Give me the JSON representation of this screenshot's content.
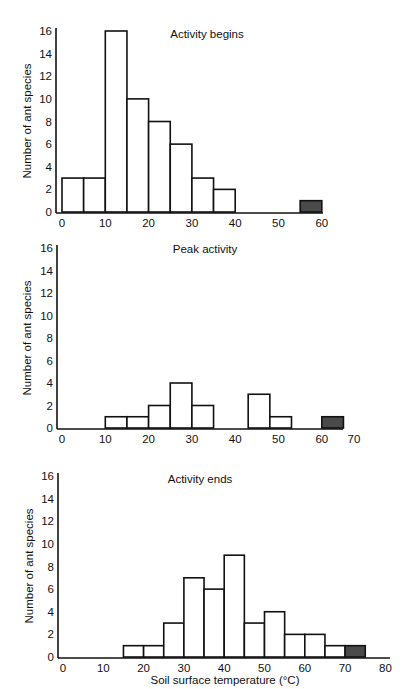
{
  "chart_data": [
    {
      "type": "bar",
      "title": "Activity begins",
      "xlabel": "",
      "ylabel": "Number of ant species",
      "ylim": [
        0,
        16
      ],
      "yticks": [
        0,
        2,
        4,
        6,
        8,
        10,
        12,
        14,
        16
      ],
      "xticks": [
        0,
        10,
        20,
        30,
        40,
        50,
        60
      ],
      "xlim": [
        0,
        60
      ],
      "bin_width": 5,
      "bins": [
        {
          "start": 0,
          "end": 5,
          "value": 3,
          "shaded": false
        },
        {
          "start": 5,
          "end": 10,
          "value": 3,
          "shaded": false
        },
        {
          "start": 10,
          "end": 15,
          "value": 16,
          "shaded": false
        },
        {
          "start": 15,
          "end": 20,
          "value": 10,
          "shaded": false
        },
        {
          "start": 20,
          "end": 25,
          "value": 8,
          "shaded": false
        },
        {
          "start": 25,
          "end": 30,
          "value": 6,
          "shaded": false
        },
        {
          "start": 30,
          "end": 35,
          "value": 3,
          "shaded": false
        },
        {
          "start": 35,
          "end": 40,
          "value": 2,
          "shaded": false
        },
        {
          "start": 55,
          "end": 60,
          "value": 1,
          "shaded": true
        }
      ],
      "grid": false
    },
    {
      "type": "bar",
      "title": "Peak activity",
      "xlabel": "",
      "ylabel": "Number of ant species",
      "ylim": [
        0,
        16
      ],
      "yticks": [
        0,
        2,
        4,
        6,
        8,
        10,
        12,
        14,
        16
      ],
      "xticks": [
        0,
        10,
        20,
        30,
        40,
        50,
        60,
        70
      ],
      "xlim": [
        0,
        70
      ],
      "bin_width": 5,
      "bins": [
        {
          "start": 10,
          "end": 15,
          "value": 1,
          "shaded": false
        },
        {
          "start": 15,
          "end": 20,
          "value": 1,
          "shaded": false
        },
        {
          "start": 20,
          "end": 25,
          "value": 2,
          "shaded": false
        },
        {
          "start": 25,
          "end": 30,
          "value": 4,
          "shaded": false
        },
        {
          "start": 30,
          "end": 35,
          "value": 2,
          "shaded": false
        },
        {
          "start": 43,
          "end": 48,
          "value": 3,
          "shaded": false
        },
        {
          "start": 48,
          "end": 53,
          "value": 1,
          "shaded": false
        },
        {
          "start": 60,
          "end": 65,
          "value": 1,
          "shaded": true
        }
      ],
      "grid": false
    },
    {
      "type": "bar",
      "title": "Activity ends",
      "xlabel": "Soil surface temperature (°C)",
      "ylabel": "Number of ant species",
      "ylim": [
        0,
        16
      ],
      "yticks": [
        0,
        2,
        4,
        6,
        8,
        10,
        12,
        14,
        16
      ],
      "xticks": [
        0,
        10,
        20,
        30,
        40,
        50,
        60,
        70,
        80
      ],
      "xlim": [
        0,
        80
      ],
      "bin_width": 5,
      "bins": [
        {
          "start": 15,
          "end": 20,
          "value": 1,
          "shaded": false
        },
        {
          "start": 20,
          "end": 25,
          "value": 1,
          "shaded": false
        },
        {
          "start": 25,
          "end": 30,
          "value": 3,
          "shaded": false
        },
        {
          "start": 30,
          "end": 35,
          "value": 7,
          "shaded": false
        },
        {
          "start": 35,
          "end": 40,
          "value": 6,
          "shaded": false
        },
        {
          "start": 40,
          "end": 45,
          "value": 9,
          "shaded": false
        },
        {
          "start": 45,
          "end": 50,
          "value": 3,
          "shaded": false
        },
        {
          "start": 50,
          "end": 55,
          "value": 4,
          "shaded": false
        },
        {
          "start": 55,
          "end": 60,
          "value": 2,
          "shaded": false
        },
        {
          "start": 60,
          "end": 65,
          "value": 2,
          "shaded": false
        },
        {
          "start": 65,
          "end": 70,
          "value": 1,
          "shaded": false
        },
        {
          "start": 70,
          "end": 75,
          "value": 1,
          "shaded": true
        }
      ],
      "grid": false
    }
  ],
  "colors": {
    "bar_fill": "#ffffff",
    "shaded_fill": "#4a4a4a",
    "stroke": "#111111"
  }
}
